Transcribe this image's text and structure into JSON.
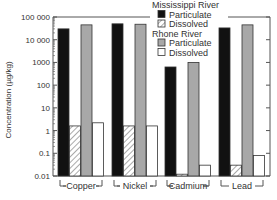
{
  "chart_data": {
    "type": "bar",
    "title": "",
    "xlabel": "",
    "ylabel": "Concentration (µg/kg)",
    "yscale": "log",
    "ylim": [
      0.01,
      100000
    ],
    "yticks": [
      "100 000",
      "10 000",
      "1000",
      "100",
      "10",
      "1",
      "0.1",
      "0.01"
    ],
    "categories": [
      "Copper",
      "Nickel",
      "Cadmium",
      "Lead"
    ],
    "series": [
      {
        "name": "Mississippi River Particulate",
        "group": "Mississippi River",
        "style": "black",
        "values": [
          30000,
          50000,
          630,
          33000
        ]
      },
      {
        "name": "Mississippi River Dissolved",
        "group": "Mississippi River",
        "style": "hatched",
        "values": [
          1.6,
          1.6,
          0.012,
          0.03
        ]
      },
      {
        "name": "Rhone River Particulate",
        "group": "Rhone River",
        "style": "gray",
        "values": [
          45000,
          48000,
          1000,
          45000
        ]
      },
      {
        "name": "Rhone River Dissolved",
        "group": "Rhone River",
        "style": "white",
        "values": [
          2.2,
          1.6,
          0.03,
          0.08
        ]
      }
    ],
    "legend": {
      "position": "top-right-inside",
      "groups": [
        {
          "title": "Mississippi River",
          "items": [
            "Particulate",
            "Dissolved"
          ]
        },
        {
          "title": "Rhone River",
          "items": [
            "Particulate",
            "Dissolved"
          ]
        }
      ]
    },
    "grid": false
  },
  "colors": {
    "particulate_miss": "#111111",
    "dissolved_miss": "#ffffff",
    "particulate_rhone": "#a8a8a8",
    "dissolved_rhone": "#ffffff",
    "axis": "#555555"
  }
}
